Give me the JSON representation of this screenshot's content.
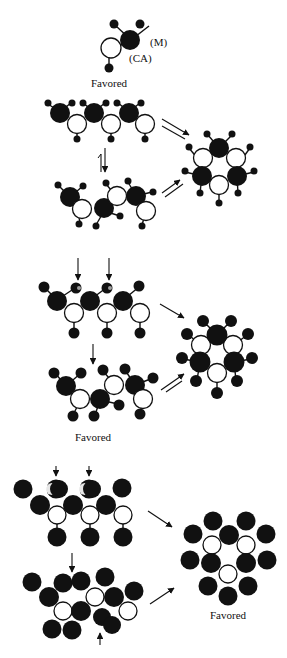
{
  "legend": {
    "m_label": "(M)",
    "ca_label": "(CA)",
    "favored_label": "Favored"
  },
  "panels": [
    {
      "name": "small-substituent",
      "linear_chain": "extended zig-zag chain, small substituents",
      "cyclic_product": "hexagonal ring with small substituents",
      "favored_label": null
    },
    {
      "name": "medium-substituent",
      "linear_chain": "twisted chain with medium substituents",
      "cyclic_product": "hexagonal ring with medium substituents",
      "favored_label": "Favored"
    },
    {
      "name": "large-substituent",
      "linear_chain": "crowded chain with large substituents",
      "cyclic_product": "hexagonal ring with large substituents",
      "favored_label": "Favored"
    }
  ],
  "colors": {
    "metal_atom": "#111111",
    "ca_atom": "#ffffff",
    "outline": "#111111"
  }
}
